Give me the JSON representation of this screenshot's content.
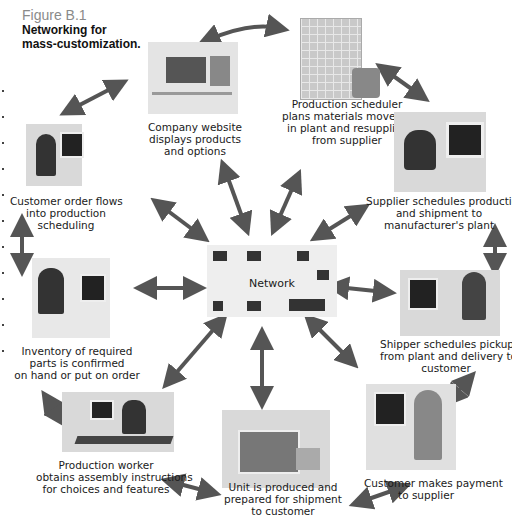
{
  "figure": {
    "number": "Figure B.1",
    "title_line1": "Networking for",
    "title_line2": "mass-customization."
  },
  "center": {
    "label": "Network",
    "icon": "server-rack-icon"
  },
  "nodes": [
    {
      "id": "company-website",
      "icon": "website-screen-icon",
      "lines": [
        "Company website",
        "displays products",
        "and options"
      ]
    },
    {
      "id": "production-scheduler",
      "icon": "warehouse-forklift-icon",
      "lines": [
        "Production scheduler",
        "plans materials movements",
        "in plant and resupplies",
        "from supplier"
      ]
    },
    {
      "id": "supplier-schedules",
      "icon": "person-at-computer-icon",
      "lines": [
        "Supplier schedules production",
        "and shipment to",
        "manufacturer's plant"
      ]
    },
    {
      "id": "shipper-schedules",
      "icon": "person-at-computer-icon",
      "lines": [
        "Shipper schedules pickup",
        "from plant and delivery to",
        "customer"
      ]
    },
    {
      "id": "customer-payment",
      "icon": "person-at-computer-icon",
      "lines": [
        "Customer makes payment",
        "to supplier"
      ]
    },
    {
      "id": "unit-produced",
      "icon": "delivery-truck-icon",
      "lines": [
        "Unit is produced and",
        "prepared for shipment",
        "to customer"
      ]
    },
    {
      "id": "production-worker",
      "icon": "assembly-line-icon",
      "lines": [
        "Production worker",
        "obtains assembly instructions",
        "for choices and features"
      ]
    },
    {
      "id": "inventory-confirmed",
      "icon": "person-at-computer-icon",
      "lines": [
        "Inventory of required",
        "parts is confirmed",
        "on hand or put on order"
      ]
    },
    {
      "id": "customer-order",
      "icon": "person-at-computer-icon",
      "lines": [
        "Customer order flows",
        "into production",
        "scheduling"
      ]
    }
  ],
  "colors": {
    "arrow": "#555555",
    "panel": "#d6d6d6",
    "figure_number": "#8a8a8a"
  }
}
